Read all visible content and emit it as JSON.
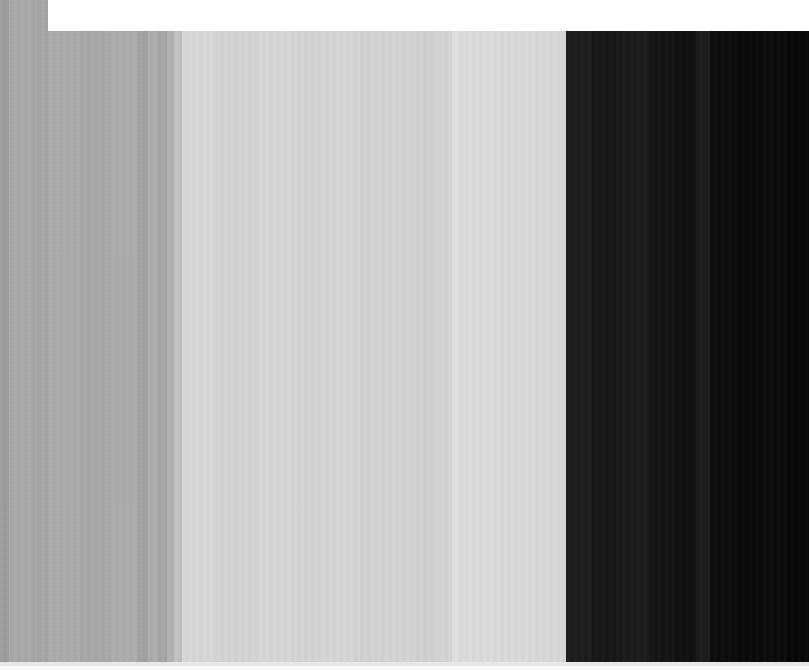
{
  "capture": {
    "title": "Zoomed UI Capture",
    "width": 809,
    "height": 670,
    "description": "Extreme-zoom screenshot rendered as vertical grey bands with a white notch at top-left and a bright strip at the bottom edge."
  },
  "palette": {
    "white": "#ffffff",
    "edge_shadow": "#9b9b9b",
    "mid_grey": "#a8a8a8",
    "light_grey": "#d2d2d2",
    "pale_grey": "#dcdcdc",
    "near_black": "#111111",
    "black": "#070707"
  },
  "regions": {
    "top_white_panel": {
      "name": "top-white-panel",
      "x": 48,
      "y": 0,
      "width": 761,
      "height": 31,
      "color": "#ffffff"
    },
    "bottom_light_strip": {
      "name": "bottom-light-strip",
      "y": 662,
      "height": 4,
      "color": "#e8e8e8"
    },
    "bottom_white_strip": {
      "name": "bottom-white-strip",
      "y": 666,
      "height": 4,
      "color": "#fbfbfb"
    }
  },
  "bands": [
    {
      "label": "left-edge-shadow",
      "x": 0,
      "width": 9,
      "color": "#9d9d9d"
    },
    {
      "label": "left-mid-grey-a",
      "x": 9,
      "width": 24,
      "color": "#a9a9a9"
    },
    {
      "label": "left-mid-grey-b",
      "x": 33,
      "width": 15,
      "color": "#a6a6a6"
    },
    {
      "label": "left-mid-grey-c",
      "x": 48,
      "width": 32,
      "color": "#ababab"
    },
    {
      "label": "left-mid-grey-d",
      "x": 80,
      "width": 30,
      "color": "#a8a8a8"
    },
    {
      "label": "left-mid-grey-e",
      "x": 110,
      "width": 28,
      "color": "#acacac"
    },
    {
      "label": "left-mid-grey-f",
      "x": 138,
      "width": 10,
      "color": "#a2a2a2"
    },
    {
      "label": "left-mid-grey-g",
      "x": 148,
      "width": 10,
      "color": "#adadad"
    },
    {
      "label": "left-mid-grey-h",
      "x": 158,
      "width": 9,
      "color": "#a5a5a5"
    },
    {
      "label": "left-mid-grey-i",
      "x": 167,
      "width": 7,
      "color": "#b2b2b2"
    },
    {
      "label": "transition-to-light",
      "x": 174,
      "width": 8,
      "color": "#c2c2c2"
    },
    {
      "label": "light-panel-a",
      "x": 182,
      "width": 34,
      "color": "#d7d7d7"
    },
    {
      "label": "light-panel-b",
      "x": 216,
      "width": 40,
      "color": "#d4d4d4"
    },
    {
      "label": "light-panel-c",
      "x": 256,
      "width": 36,
      "color": "#d6d6d6"
    },
    {
      "label": "light-panel-d",
      "x": 292,
      "width": 28,
      "color": "#d3d3d3"
    },
    {
      "label": "light-panel-e",
      "x": 320,
      "width": 34,
      "color": "#d5d5d5"
    },
    {
      "label": "light-panel-f",
      "x": 354,
      "width": 30,
      "color": "#d2d2d2"
    },
    {
      "label": "light-panel-g",
      "x": 384,
      "width": 30,
      "color": "#d4d4d4"
    },
    {
      "label": "light-panel-h",
      "x": 414,
      "width": 24,
      "color": "#d1d1d1"
    },
    {
      "label": "light-panel-i",
      "x": 438,
      "width": 14,
      "color": "#d4d4d4"
    },
    {
      "label": "bright-divider-line",
      "x": 452,
      "width": 7,
      "color": "#e0e0e0"
    },
    {
      "label": "pale-panel-a",
      "x": 459,
      "width": 38,
      "color": "#dcdcdc"
    },
    {
      "label": "pale-panel-b",
      "x": 497,
      "width": 38,
      "color": "#dadada"
    },
    {
      "label": "pale-panel-c",
      "x": 535,
      "width": 31,
      "color": "#d8d8d8"
    },
    {
      "label": "dark-panel-a",
      "x": 566,
      "width": 26,
      "color": "#1c1c1c"
    },
    {
      "label": "dark-panel-b",
      "x": 592,
      "width": 30,
      "color": "#171717"
    },
    {
      "label": "dark-panel-c",
      "x": 622,
      "width": 28,
      "color": "#1a1a1a"
    },
    {
      "label": "dark-panel-d",
      "x": 650,
      "width": 24,
      "color": "#141414"
    },
    {
      "label": "dark-panel-e",
      "x": 674,
      "width": 22,
      "color": "#101010"
    },
    {
      "label": "dark-panel-f",
      "x": 696,
      "width": 14,
      "color": "#1b1b1b"
    },
    {
      "label": "dark-panel-g",
      "x": 710,
      "width": 26,
      "color": "#0c0c0c"
    },
    {
      "label": "dark-panel-h",
      "x": 736,
      "width": 26,
      "color": "#090909"
    },
    {
      "label": "dark-panel-i",
      "x": 762,
      "width": 24,
      "color": "#0b0b0b"
    },
    {
      "label": "dark-panel-j",
      "x": 786,
      "width": 23,
      "color": "#070707"
    }
  ]
}
